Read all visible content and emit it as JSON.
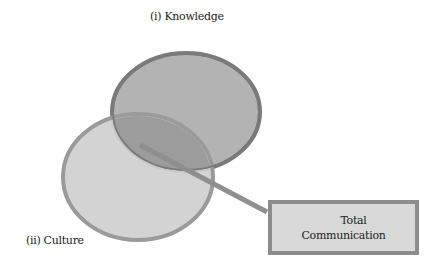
{
  "diagram": {
    "top_circle_label": "(i) Knowledge",
    "bottom_circle_label": "(ii) Culture",
    "result_box": {
      "line1": "Total",
      "line2": "Communication"
    },
    "colors": {
      "knowledge_fill": "#b3b3b3",
      "knowledge_stroke": "#7a7a7a",
      "culture_fill": "#cfcfcf",
      "culture_stroke": "#9a9a9a",
      "overlap_fill": "#9c9c9c",
      "connector": "#8f8f8f",
      "box_fill": "#d9d9d9",
      "box_stroke": "#8c8c8c"
    }
  }
}
